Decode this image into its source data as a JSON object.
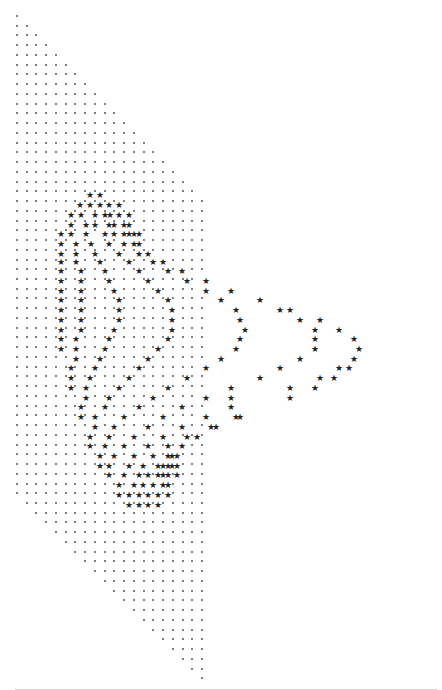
{
  "figure": {
    "dot_glyph": ".",
    "star_glyph": "★",
    "colors": {
      "background": "#ffffff",
      "dot": "#555555",
      "star": "#222222",
      "baseline": "#d6d6d6"
    },
    "grid": {
      "origin_x": 17,
      "origin_y": 16,
      "pitch_x": 9.74,
      "pitch_y": 9.74,
      "rows": 69,
      "cols": 20,
      "rule": "col <= row && col >= row - 49"
    },
    "stars": [
      [
        90,
        195
      ],
      [
        100,
        195
      ],
      [
        80,
        205
      ],
      [
        90,
        205
      ],
      [
        100,
        205
      ],
      [
        109,
        205
      ],
      [
        119,
        205
      ],
      [
        71,
        215
      ],
      [
        81,
        215
      ],
      [
        95,
        215
      ],
      [
        105,
        215
      ],
      [
        110,
        215
      ],
      [
        119,
        215
      ],
      [
        129,
        215
      ],
      [
        71,
        225
      ],
      [
        86,
        225
      ],
      [
        95,
        225
      ],
      [
        109,
        225
      ],
      [
        114,
        225
      ],
      [
        124,
        225
      ],
      [
        129,
        225
      ],
      [
        61,
        234
      ],
      [
        71,
        234
      ],
      [
        86,
        234
      ],
      [
        105,
        234
      ],
      [
        114,
        234
      ],
      [
        124,
        234
      ],
      [
        129,
        234
      ],
      [
        134,
        234
      ],
      [
        139,
        234
      ],
      [
        61,
        244
      ],
      [
        76,
        244
      ],
      [
        91,
        244
      ],
      [
        109,
        244
      ],
      [
        124,
        244
      ],
      [
        134,
        244
      ],
      [
        139,
        244
      ],
      [
        61,
        254
      ],
      [
        76,
        254
      ],
      [
        95,
        254
      ],
      [
        119,
        254
      ],
      [
        139,
        254
      ],
      [
        148,
        254
      ],
      [
        61,
        262
      ],
      [
        76,
        262
      ],
      [
        100,
        262
      ],
      [
        129,
        262
      ],
      [
        153,
        262
      ],
      [
        163,
        262
      ],
      [
        61,
        271
      ],
      [
        81,
        271
      ],
      [
        105,
        271
      ],
      [
        139,
        271
      ],
      [
        168,
        271
      ],
      [
        182,
        271
      ],
      [
        61,
        281
      ],
      [
        81,
        281
      ],
      [
        109,
        281
      ],
      [
        148,
        281
      ],
      [
        187,
        281
      ],
      [
        206,
        281
      ],
      [
        61,
        291
      ],
      [
        81,
        291
      ],
      [
        114,
        291
      ],
      [
        158,
        291
      ],
      [
        206,
        291
      ],
      [
        231,
        291
      ],
      [
        61,
        300
      ],
      [
        81,
        300
      ],
      [
        119,
        300
      ],
      [
        168,
        300
      ],
      [
        221,
        300
      ],
      [
        260,
        300
      ],
      [
        61,
        310
      ],
      [
        81,
        310
      ],
      [
        119,
        310
      ],
      [
        172,
        310
      ],
      [
        236,
        310
      ],
      [
        280,
        310
      ],
      [
        290,
        310
      ],
      [
        61,
        320
      ],
      [
        81,
        320
      ],
      [
        119,
        320
      ],
      [
        172,
        320
      ],
      [
        240,
        320
      ],
      [
        300,
        320
      ],
      [
        320,
        320
      ],
      [
        61,
        330
      ],
      [
        81,
        330
      ],
      [
        114,
        330
      ],
      [
        172,
        330
      ],
      [
        245,
        330
      ],
      [
        315,
        330
      ],
      [
        339,
        330
      ],
      [
        61,
        339
      ],
      [
        76,
        339
      ],
      [
        109,
        339
      ],
      [
        168,
        339
      ],
      [
        240,
        339
      ],
      [
        315,
        339
      ],
      [
        354,
        339
      ],
      [
        61,
        349
      ],
      [
        76,
        349
      ],
      [
        105,
        349
      ],
      [
        158,
        349
      ],
      [
        236,
        349
      ],
      [
        315,
        349
      ],
      [
        359,
        349
      ],
      [
        76,
        359
      ],
      [
        100,
        359
      ],
      [
        148,
        359
      ],
      [
        221,
        359
      ],
      [
        300,
        359
      ],
      [
        354,
        359
      ],
      [
        71,
        368
      ],
      [
        95,
        368
      ],
      [
        139,
        368
      ],
      [
        206,
        368
      ],
      [
        280,
        368
      ],
      [
        339,
        368
      ],
      [
        349,
        368
      ],
      [
        71,
        378
      ],
      [
        90,
        378
      ],
      [
        129,
        378
      ],
      [
        187,
        378
      ],
      [
        260,
        378
      ],
      [
        320,
        378
      ],
      [
        334,
        378
      ],
      [
        71,
        388
      ],
      [
        86,
        388
      ],
      [
        119,
        388
      ],
      [
        168,
        388
      ],
      [
        231,
        388
      ],
      [
        290,
        388
      ],
      [
        315,
        388
      ],
      [
        86,
        398
      ],
      [
        109,
        398
      ],
      [
        153,
        398
      ],
      [
        206,
        398
      ],
      [
        231,
        398
      ],
      [
        290,
        398
      ],
      [
        81,
        407
      ],
      [
        105,
        407
      ],
      [
        139,
        407
      ],
      [
        182,
        407
      ],
      [
        231,
        407
      ],
      [
        81,
        417
      ],
      [
        95,
        417
      ],
      [
        124,
        417
      ],
      [
        163,
        417
      ],
      [
        206,
        417
      ],
      [
        236,
        417
      ],
      [
        240,
        417
      ],
      [
        95,
        427
      ],
      [
        114,
        427
      ],
      [
        148,
        427
      ],
      [
        182,
        427
      ],
      [
        211,
        427
      ],
      [
        216,
        427
      ],
      [
        90,
        437
      ],
      [
        109,
        437
      ],
      [
        134,
        437
      ],
      [
        163,
        437
      ],
      [
        187,
        437
      ],
      [
        197,
        437
      ],
      [
        90,
        446
      ],
      [
        105,
        446
      ],
      [
        124,
        446
      ],
      [
        148,
        446
      ],
      [
        168,
        446
      ],
      [
        182,
        446
      ],
      [
        100,
        456
      ],
      [
        114,
        456
      ],
      [
        134,
        456
      ],
      [
        153,
        456
      ],
      [
        168,
        456
      ],
      [
        172,
        456
      ],
      [
        177,
        456
      ],
      [
        100,
        466
      ],
      [
        109,
        466
      ],
      [
        129,
        466
      ],
      [
        143,
        466
      ],
      [
        158,
        466
      ],
      [
        163,
        466
      ],
      [
        168,
        466
      ],
      [
        172,
        466
      ],
      [
        177,
        466
      ],
      [
        109,
        475
      ],
      [
        124,
        475
      ],
      [
        139,
        475
      ],
      [
        148,
        475
      ],
      [
        158,
        475
      ],
      [
        163,
        475
      ],
      [
        168,
        475
      ],
      [
        177,
        475
      ],
      [
        119,
        485
      ],
      [
        134,
        485
      ],
      [
        143,
        485
      ],
      [
        153,
        485
      ],
      [
        163,
        485
      ],
      [
        168,
        485
      ],
      [
        119,
        495
      ],
      [
        129,
        495
      ],
      [
        139,
        495
      ],
      [
        148,
        495
      ],
      [
        158,
        495
      ],
      [
        168,
        495
      ],
      [
        129,
        505
      ],
      [
        139,
        505
      ],
      [
        148,
        505
      ],
      [
        158,
        505
      ]
    ]
  }
}
